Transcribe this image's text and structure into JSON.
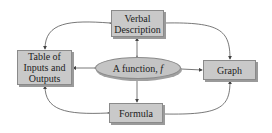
{
  "diagram": {
    "center": {
      "label": "A function, ",
      "symbol": "f"
    },
    "nodes": {
      "verbal": {
        "line1": "Verbal",
        "line2": "Description"
      },
      "table": {
        "line1": "Table of",
        "line2": "Inputs and",
        "line3": "Outputs"
      },
      "graph": {
        "label": "Graph"
      },
      "formula": {
        "label": "Formula"
      }
    },
    "edges": [
      [
        "A function, f",
        "Verbal Description"
      ],
      [
        "A function, f",
        "Table of Inputs and Outputs"
      ],
      [
        "A function, f",
        "Graph"
      ],
      [
        "A function, f",
        "Formula"
      ],
      [
        "Verbal Description",
        "Table of Inputs and Outputs"
      ],
      [
        "Verbal Description",
        "Graph"
      ],
      [
        "Formula",
        "Table of Inputs and Outputs"
      ],
      [
        "Formula",
        "Graph"
      ]
    ],
    "colors": {
      "box_fill": "#c9c9c9",
      "line": "#555555"
    }
  }
}
